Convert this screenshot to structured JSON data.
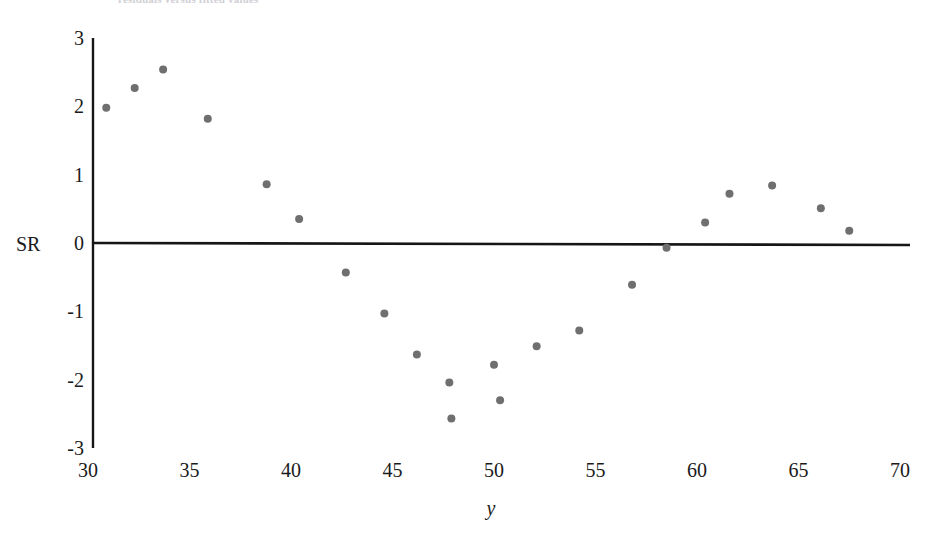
{
  "figure": {
    "clipped_top_caption": "residuals versus fitted values",
    "background_color": "#ffffff",
    "point_color": "#6f6f6f",
    "axis_color": "#161616"
  },
  "chart_data": {
    "type": "scatter",
    "title": "",
    "subtitle": "",
    "xlabel": "y",
    "ylabel": "SR",
    "xlim": [
      30,
      70
    ],
    "ylim": [
      -3,
      3
    ],
    "xticks": [
      30,
      35,
      40,
      45,
      50,
      55,
      60,
      65,
      70
    ],
    "yticks": [
      3,
      2,
      1,
      0,
      -1,
      -2,
      -3
    ],
    "xtick_labels": [
      "30",
      "35",
      "40",
      "45",
      "50",
      "55",
      "60",
      "65",
      "70"
    ],
    "ytick_labels": [
      "3",
      "2",
      "1",
      "0",
      "-1",
      "-2",
      "-3"
    ],
    "grid": false,
    "legend": null,
    "legend_position": "none",
    "zero_reference_line": 0,
    "marker": "filled-circle",
    "marker_size": 8,
    "series": [
      {
        "name": "SR",
        "x": [
          30.9,
          32.3,
          33.7,
          35.9,
          38.8,
          40.4,
          42.7,
          44.6,
          46.2,
          47.8,
          47.9,
          50.0,
          50.3,
          52.1,
          54.2,
          56.8,
          58.5,
          60.4,
          61.6,
          63.7,
          66.1,
          67.5
        ],
        "y": [
          1.98,
          2.27,
          2.54,
          1.82,
          0.86,
          0.35,
          -0.43,
          -1.03,
          -1.63,
          -2.04,
          -2.57,
          -1.78,
          -2.3,
          -1.51,
          -1.28,
          -0.61,
          -0.07,
          0.3,
          0.72,
          0.84,
          0.51,
          0.18
        ]
      }
    ]
  }
}
